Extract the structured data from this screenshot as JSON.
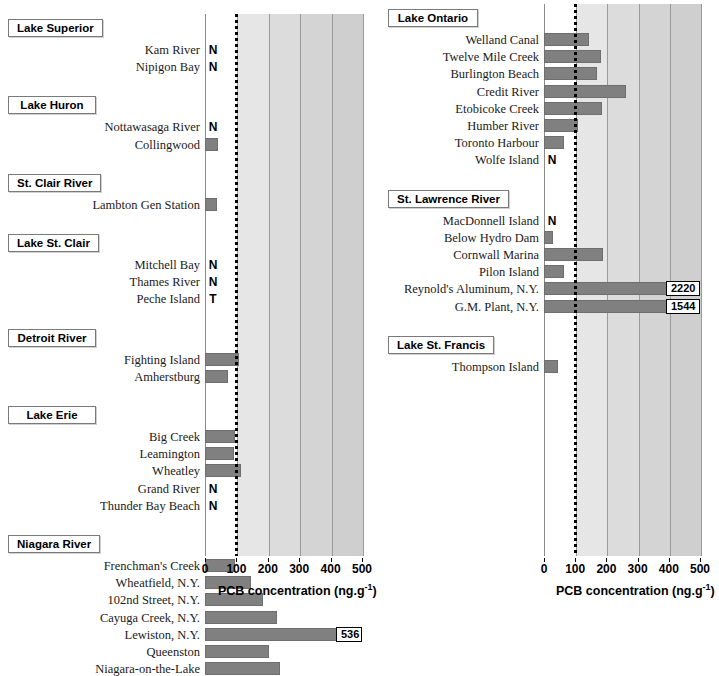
{
  "figure": {
    "axis_title_main": "PCB concentration (ng.g",
    "axis_title_sup": "-1",
    "axis_title_close": ")",
    "tick_labels": [
      "0",
      "100",
      "200",
      "300",
      "400",
      "500"
    ],
    "tick_values": [
      0,
      100,
      200,
      300,
      400,
      500
    ],
    "nd_symbol": "N",
    "trace_symbol": "T",
    "bar_color": "#808080",
    "plot_band_color": "#d4d4d4",
    "reference_line_value": 100
  },
  "chart_data": {
    "type": "bar",
    "title": "",
    "xlabel": "PCB concentration (ng.g-1)",
    "ylabel": "",
    "xlim": [
      0,
      500
    ],
    "grid": true,
    "orientation": "horizontal",
    "reference_line": 100,
    "legend": [],
    "panels": [
      {
        "panel_id": "left",
        "groups": [
          {
            "name": "Lake Superior",
            "sites": [
              {
                "label": "Kam River",
                "value": null,
                "flag": "N"
              },
              {
                "label": "Nipigon Bay",
                "value": null,
                "flag": "N"
              }
            ]
          },
          {
            "name": "Lake Huron",
            "sites": [
              {
                "label": "Nottawasaga River",
                "value": null,
                "flag": "N"
              },
              {
                "label": "Collingwood",
                "value": 40,
                "flag": null
              }
            ]
          },
          {
            "name": "St. Clair River",
            "sites": [
              {
                "label": "Lambton Gen Station",
                "value": 38,
                "flag": null
              }
            ]
          },
          {
            "name": "Lake St. Clair",
            "sites": [
              {
                "label": "Mitchell Bay",
                "value": null,
                "flag": "N"
              },
              {
                "label": "Thames River",
                "value": null,
                "flag": "N"
              },
              {
                "label": "Peche Island",
                "value": null,
                "flag": "T"
              }
            ]
          },
          {
            "name": "Detroit River",
            "sites": [
              {
                "label": "Fighting Island",
                "value": 108,
                "flag": null
              },
              {
                "label": "Amherstburg",
                "value": 72,
                "flag": null
              }
            ]
          },
          {
            "name": "Lake Erie",
            "sites": [
              {
                "label": "Big Creek",
                "value": 95,
                "flag": null
              },
              {
                "label": "Leamington",
                "value": 92,
                "flag": null
              },
              {
                "label": "Wheatley",
                "value": 115,
                "flag": null
              },
              {
                "label": "Grand River",
                "value": null,
                "flag": "N"
              },
              {
                "label": "Thunder Bay Beach",
                "value": null,
                "flag": "N"
              }
            ]
          },
          {
            "name": "Niagara River",
            "sites": [
              {
                "label": "Frenchman's Creek",
                "value": 97,
                "flag": null
              },
              {
                "label": "Wheatfield, N.Y.",
                "value": 145,
                "flag": null
              },
              {
                "label": "102nd Street, N.Y.",
                "value": 185,
                "flag": null
              },
              {
                "label": "Cayuga Creek, N.Y.",
                "value": 230,
                "flag": null
              },
              {
                "label": "Lewiston, N.Y.",
                "value": 536,
                "flag": null,
                "value_label": "536"
              },
              {
                "label": "Queenston",
                "value": 205,
                "flag": null
              },
              {
                "label": "Niagara-on-the-Lake",
                "value": 238,
                "flag": null
              }
            ]
          }
        ]
      },
      {
        "panel_id": "right",
        "groups": [
          {
            "name": "Lake Ontario",
            "sites": [
              {
                "label": "Welland Canal",
                "value": 145,
                "flag": null
              },
              {
                "label": "Twelve Mile Creek",
                "value": 182,
                "flag": null
              },
              {
                "label": "Burlington Beach",
                "value": 170,
                "flag": null
              },
              {
                "label": "Credit River",
                "value": 262,
                "flag": null
              },
              {
                "label": "Etobicoke Creek",
                "value": 185,
                "flag": null
              },
              {
                "label": "Humber River",
                "value": 110,
                "flag": null
              },
              {
                "label": "Toronto Harbour",
                "value": 63,
                "flag": null
              },
              {
                "label": "Wolfe Island",
                "value": null,
                "flag": "N"
              }
            ]
          },
          {
            "name": "St. Lawrence River",
            "sites": [
              {
                "label": "MacDonnell Island",
                "value": null,
                "flag": "N"
              },
              {
                "label": "Below Hydro Dam",
                "value": 30,
                "flag": null
              },
              {
                "label": "Cornwall Marina",
                "value": 190,
                "flag": null
              },
              {
                "label": "Pilon Island",
                "value": 63,
                "flag": null
              },
              {
                "label": "Reynold's Aluminum, N.Y.",
                "value": 2220,
                "flag": null,
                "value_label": "2220"
              },
              {
                "label": "G.M. Plant, N.Y.",
                "value": 1544,
                "flag": null,
                "value_label": "1544"
              }
            ]
          },
          {
            "name": "Lake St. Francis",
            "sites": [
              {
                "label": "Thompson Island",
                "value": 45,
                "flag": null
              }
            ]
          }
        ]
      }
    ]
  }
}
